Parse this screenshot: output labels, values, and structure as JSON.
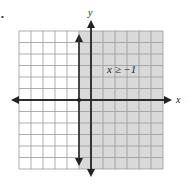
{
  "chart_data": {
    "type": "region",
    "title": "",
    "xlabel": "x",
    "ylabel": "y",
    "xlim": [
      -6,
      6
    ],
    "ylim": [
      -6,
      6
    ],
    "grid": true,
    "inequality": "x ≥ -1",
    "boundary": {
      "type": "vertical_line",
      "x": -1,
      "style": "solid",
      "arrows": true
    },
    "shaded_region": "x >= -1",
    "colors": {
      "shade": "#d9d9d9",
      "grid": "#9a9a9a",
      "axis": "#222222"
    }
  },
  "labels": {
    "x_axis": "x",
    "y_axis": "y",
    "inequality": "x ≥ −1",
    "bullet": "•"
  }
}
